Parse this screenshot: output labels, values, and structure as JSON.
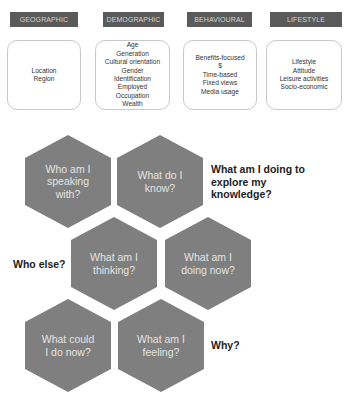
{
  "segments": [
    {
      "header": "GEOGRAPHIC",
      "items": [
        "Location",
        "Region"
      ]
    },
    {
      "header": "DEMOGRAPHIC",
      "items": [
        "Age",
        "Generation",
        "Cultural orientation",
        "Gender",
        "Identification",
        "Employed",
        "Occupation",
        "Wealth"
      ]
    },
    {
      "header": "BEHAVIOURAL",
      "items": [
        "Benefits-focused",
        "$",
        "Time-based",
        "Fixed views",
        "Media usage"
      ]
    },
    {
      "header": "LIFESTYLE",
      "items": [
        "Lifestyle",
        "Attitude",
        "Leisure activities",
        "Socio-economic"
      ]
    }
  ],
  "hexagons": [
    {
      "lines": [
        "Who am I",
        "speaking",
        "with?"
      ]
    },
    {
      "lines": [
        "What do I",
        "know?"
      ]
    },
    {
      "lines": [
        "What am I",
        "thinking?"
      ]
    },
    {
      "lines": [
        "What am I",
        "doing now?"
      ]
    },
    {
      "lines": [
        "What could",
        "I do now?"
      ]
    },
    {
      "lines": [
        "What am I",
        "feeling?"
      ]
    }
  ],
  "labels": {
    "explore": [
      "What am I doing to",
      "explore my",
      "knowledge?"
    ],
    "who_else": "Who else?",
    "why": "Why?"
  },
  "colors": {
    "header_fill": "#5a5a5a",
    "header_text": "#d6d6d6",
    "hex_fill": "#7f7f7f",
    "hex_text": "#e4e4e4",
    "label_text": "#222222"
  }
}
